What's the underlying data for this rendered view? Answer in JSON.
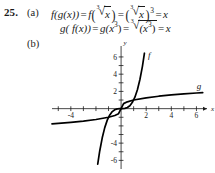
{
  "exercise": {
    "number": "25.",
    "part_a_label": "(a)",
    "part_b_label": "(b)"
  },
  "solution": {
    "line1": {
      "lhs": "f(g(x))",
      "eq1": "=",
      "term1_fn": "f",
      "term1_radicand": "x",
      "term1_index": "3",
      "eq2": "=",
      "term2_radicand": "x",
      "term2_index": "3",
      "term2_exponent": "3",
      "eq3": "=",
      "rhs": "x"
    },
    "line2": {
      "lhs": "g( f(x))",
      "eq1": "=",
      "term1": "g(x",
      "term1_exponent": "3",
      "term1_close": ")",
      "eq2": "=",
      "term2_radicand": "(x",
      "term2_exponent": "3",
      "term2_radicand_close": ")",
      "term2_index": "3",
      "eq3": "=",
      "rhs": "x"
    }
  },
  "chart_data": {
    "type": "line",
    "title": "",
    "xlabel": "x",
    "ylabel": "y",
    "xlim": [
      -5.5,
      7
    ],
    "ylim": [
      -7,
      7.5
    ],
    "grid": false,
    "legend_position": "inline-curve-labels",
    "x_tick_labels": [
      "-4",
      "2",
      "4",
      "6"
    ],
    "x_tick_values": [
      -4,
      2,
      4,
      6
    ],
    "y_tick_labels": [
      "6",
      "4",
      "2",
      "-4",
      "-6"
    ],
    "y_tick_values": [
      6,
      4,
      2,
      -4,
      -6
    ],
    "x_ticks_all": [
      -5,
      -4,
      -3,
      -2,
      -1,
      1,
      2,
      3,
      4,
      5,
      6
    ],
    "y_ticks_all": [
      -6,
      -5,
      -4,
      -3,
      -2,
      -1,
      1,
      2,
      3,
      4,
      5,
      6
    ],
    "series": [
      {
        "name": "f",
        "label": "f",
        "expression": "y = x^3",
        "color": "#000000",
        "x": [
          -1.86,
          -1.7,
          -1.5,
          -1.3,
          -1.1,
          -0.9,
          -0.7,
          -0.5,
          -0.3,
          -0.1,
          0,
          0.1,
          0.3,
          0.5,
          0.7,
          0.9,
          1.1,
          1.3,
          1.5,
          1.7,
          1.86
        ],
        "y": [
          -6.43,
          -4.91,
          -3.38,
          -2.2,
          -1.33,
          -0.73,
          -0.34,
          -0.13,
          -0.03,
          0,
          0,
          0,
          0.03,
          0.13,
          0.34,
          0.73,
          1.33,
          2.2,
          3.38,
          4.91,
          6.43
        ]
      },
      {
        "name": "g",
        "label": "g",
        "expression": "y = cbrt(x)",
        "color": "#000000",
        "x": [
          -5.5,
          -5,
          -4,
          -3,
          -2,
          -1,
          -0.5,
          -0.2,
          0,
          0.2,
          0.5,
          1,
          2,
          3,
          4,
          5,
          6,
          6.5
        ],
        "y": [
          -1.765,
          -1.71,
          -1.587,
          -1.442,
          -1.26,
          -1,
          -0.794,
          -0.585,
          0,
          0.585,
          0.794,
          1,
          1.26,
          1.442,
          1.587,
          1.71,
          1.817,
          1.866
        ]
      }
    ]
  }
}
